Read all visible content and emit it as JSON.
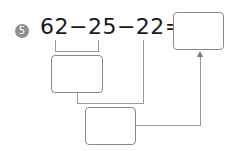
{
  "problem": {
    "number": "5",
    "expression": "62−25−22=",
    "terms": [
      "62",
      "25",
      "22"
    ],
    "operators": [
      "−",
      "−",
      "="
    ]
  },
  "boxes": {
    "step1": {
      "value": ""
    },
    "step2": {
      "value": ""
    },
    "answer": {
      "value": ""
    }
  },
  "colors": {
    "badge": "#8e8e8e",
    "text": "#1a1a1a",
    "lines": "#9a9a9a"
  }
}
